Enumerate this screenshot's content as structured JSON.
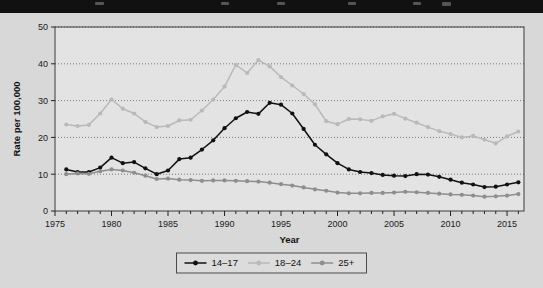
{
  "figure": {
    "background_color": "#d8d8d8",
    "plot_background_color": "#e3e3e3",
    "top_bar_color": "#111111"
  },
  "chart_data": {
    "type": "line",
    "title": "",
    "xlabel": "Year",
    "ylabel": "Rate per 100,000",
    "xlim": [
      1975,
      2016.5
    ],
    "ylim": [
      0,
      50
    ],
    "grid": true,
    "grid_axis": "y",
    "legend_position": "bottom-center",
    "xticks": [
      1975,
      1980,
      1985,
      1990,
      1995,
      2000,
      2005,
      2010,
      2015
    ],
    "xtick_labels": [
      "1975",
      "1980",
      "1985",
      "1990",
      "1995",
      "2000",
      "2005",
      "2010",
      "2015"
    ],
    "minor_xtick_interval": 1,
    "yticks": [
      0,
      10,
      20,
      30,
      40,
      50
    ],
    "ytick_labels": [
      "0",
      "10",
      "20",
      "30",
      "40",
      "50"
    ],
    "x": [
      1976,
      1977,
      1978,
      1979,
      1980,
      1981,
      1982,
      1983,
      1984,
      1985,
      1986,
      1987,
      1988,
      1989,
      1990,
      1991,
      1992,
      1993,
      1994,
      1995,
      1996,
      1997,
      1998,
      1999,
      2000,
      2001,
      2002,
      2003,
      2004,
      2005,
      2006,
      2007,
      2008,
      2009,
      2010,
      2011,
      2012,
      2013,
      2014,
      2015,
      2016
    ],
    "series": [
      {
        "name": "14–17",
        "color": "#111111",
        "marker": "circle",
        "values": [
          11.3,
          10.6,
          10.6,
          11.8,
          14.5,
          13.0,
          13.3,
          11.6,
          10.0,
          11.0,
          14.1,
          14.5,
          16.7,
          19.2,
          22.5,
          25.2,
          26.9,
          26.4,
          29.4,
          28.9,
          26.5,
          22.3,
          18.0,
          15.4,
          13.0,
          11.3,
          10.6,
          10.3,
          9.8,
          9.6,
          9.5,
          10.0,
          9.9,
          9.3,
          8.5,
          7.7,
          7.2,
          6.5,
          6.6,
          7.2,
          7.8
        ]
      },
      {
        "name": "18–24",
        "color": "#b9b9b9",
        "marker": "circle",
        "values": [
          23.5,
          23.1,
          23.4,
          26.5,
          30.3,
          27.8,
          26.5,
          24.2,
          22.8,
          23.1,
          24.6,
          24.8,
          27.3,
          30.3,
          33.8,
          39.7,
          37.5,
          41.0,
          39.3,
          36.4,
          34.1,
          31.8,
          29.0,
          24.4,
          23.6,
          25.0,
          24.9,
          24.5,
          25.7,
          26.4,
          25.1,
          24.0,
          22.8,
          21.7,
          20.9,
          20.0,
          20.4,
          19.4,
          18.4,
          20.3,
          21.6
        ]
      },
      {
        "name": "25+",
        "color": "#8e8e8e",
        "marker": "circle",
        "values": [
          10.0,
          10.2,
          10.1,
          10.8,
          11.3,
          11.0,
          10.4,
          9.6,
          8.7,
          8.8,
          8.5,
          8.4,
          8.2,
          8.3,
          8.3,
          8.2,
          8.1,
          8.0,
          7.7,
          7.3,
          6.9,
          6.4,
          5.9,
          5.5,
          5.0,
          4.8,
          4.8,
          4.9,
          4.9,
          5.0,
          5.2,
          5.1,
          4.9,
          4.7,
          4.5,
          4.4,
          4.2,
          3.9,
          4.0,
          4.2,
          4.6
        ]
      }
    ],
    "legend": [
      {
        "label": "14–17",
        "color": "#111111"
      },
      {
        "label": "18–24",
        "color": "#b9b9b9"
      },
      {
        "label": "25+",
        "color": "#8e8e8e"
      }
    ]
  }
}
